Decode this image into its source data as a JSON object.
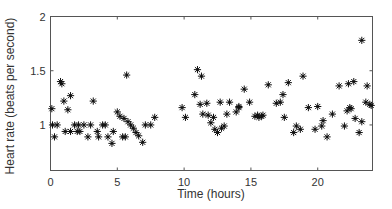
{
  "chart_data": {
    "type": "scatter",
    "title": "",
    "xlabel": "Time (hours)",
    "ylabel": "Heart rate (beats per second)",
    "xlim": [
      0,
      24.1
    ],
    "ylim": [
      0.58,
      2.0
    ],
    "xticks": [
      0,
      5,
      10,
      15,
      20
    ],
    "yticks": [
      1,
      1.5,
      2
    ],
    "ytick_labels": [
      "1",
      "1.5",
      "2"
    ],
    "grid": false,
    "legend": null,
    "marker": "asterisk",
    "color": "#111111",
    "series": [
      {
        "name": "Heart rate",
        "x": [
          0.1,
          0.15,
          0.3,
          0.5,
          0.75,
          0.85,
          1.0,
          1.1,
          1.3,
          1.5,
          1.5,
          1.8,
          2.0,
          2.1,
          2.2,
          2.5,
          2.8,
          3.0,
          3.2,
          3.5,
          3.6,
          3.9,
          4.1,
          4.3,
          4.6,
          4.7,
          5.0,
          5.2,
          5.4,
          5.5,
          5.6,
          5.7,
          5.8,
          6.0,
          6.2,
          6.4,
          6.6,
          6.9,
          7.1,
          7.5,
          7.8,
          9.85,
          10.1,
          10.8,
          11.0,
          11.2,
          11.3,
          11.4,
          11.7,
          11.8,
          12.0,
          12.2,
          12.3,
          12.5,
          12.7,
          12.8,
          13.0,
          13.2,
          13.4,
          13.9,
          14.1,
          14.1,
          14.5,
          14.9,
          15.3,
          15.5,
          15.6,
          15.8,
          15.9,
          16.3,
          16.9,
          17.2,
          17.4,
          17.5,
          17.8,
          18.2,
          18.4,
          18.7,
          18.9,
          19.3,
          19.8,
          20.0,
          20.3,
          20.4,
          20.7,
          21.1,
          21.6,
          22.0,
          22.2,
          22.3,
          22.4,
          22.5,
          22.7,
          22.8,
          23.1,
          23.3,
          23.6,
          23.7,
          23.9,
          24.0,
          23.3
        ],
        "y": [
          1.15,
          1.0,
          0.89,
          1.0,
          1.4,
          1.38,
          1.22,
          0.94,
          1.14,
          1.27,
          0.94,
          1.0,
          0.94,
          1.0,
          0.94,
          1.0,
          0.89,
          1.0,
          1.22,
          0.94,
          0.89,
          1.0,
          1.0,
          0.89,
          0.83,
          0.94,
          1.12,
          1.08,
          0.89,
          1.06,
          0.89,
          1.46,
          1.03,
          1.0,
          0.97,
          0.93,
          0.9,
          0.84,
          1.0,
          1.0,
          1.07,
          1.16,
          1.07,
          1.28,
          1.51,
          1.19,
          1.45,
          1.1,
          1.2,
          1.09,
          1.02,
          1.07,
          0.96,
          0.93,
          1.21,
          0.97,
          0.99,
          1.1,
          1.21,
          1.12,
          1.16,
          1.17,
          1.33,
          1.21,
          1.08,
          1.09,
          1.07,
          1.08,
          1.09,
          1.37,
          1.2,
          1.21,
          1.28,
          1.07,
          1.39,
          0.93,
          0.99,
          0.96,
          1.45,
          1.16,
          0.96,
          1.17,
          0.99,
          1.04,
          0.89,
          1.1,
          1.36,
          0.99,
          1.13,
          1.38,
          1.16,
          1.15,
          1.4,
          1.06,
          0.93,
          1.03,
          1.21,
          1.36,
          1.19,
          1.18,
          1.78
        ]
      }
    ]
  },
  "axes": {
    "x_label": "Time (hours)",
    "y_label": "Heart rate (beats per second)",
    "x_tick_labels": [
      "0",
      "5",
      "10",
      "15",
      "20"
    ],
    "y_tick_labels": [
      "1",
      "1.5",
      "2"
    ]
  }
}
